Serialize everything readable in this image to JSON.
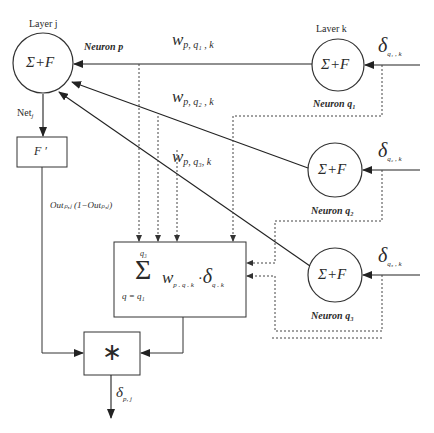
{
  "layers": {
    "j": "Layer j",
    "k": "Laver k"
  },
  "neurons": {
    "p": {
      "label": "Neuron p",
      "glyph": "Σ+F"
    },
    "q1": {
      "label": "Neuron q₁",
      "glyph": "Σ+F"
    },
    "q2": {
      "label": "Neuron q₂",
      "glyph": "Σ+F"
    },
    "q3": {
      "label": "Neuron q₃",
      "glyph": "Σ+F"
    }
  },
  "weights": {
    "w1": {
      "w": "w",
      "sub": "p, q₁ , k"
    },
    "w2": {
      "w": "w",
      "sub": "p, q₂ , k"
    },
    "w3": {
      "w": "w",
      "sub": "p, q₃, k"
    }
  },
  "deltas": {
    "d1": {
      "d": "δ",
      "sub": "q₁ , k"
    },
    "d2": {
      "d": "δ",
      "sub": "q₂ , k"
    },
    "d3": {
      "d": "δ",
      "sub": "q₃ , k"
    },
    "out": {
      "d": "δ",
      "sub": "p, j"
    }
  },
  "net": {
    "label": "Net",
    "sub": "j"
  },
  "derivative_box": {
    "label": "F ′"
  },
  "derivative_expr": "Outₚ,ⱼ (1−Outₚ,ⱼ)",
  "sum_box": {
    "sigma": "Σ",
    "upper": "q₃",
    "lower": "q = q₁",
    "term": "w",
    "term_sub": "p . q . k",
    "dot": "·",
    "delta": "δ",
    "delta_sub": "q . k"
  },
  "mult_box": {
    "label": "∗"
  }
}
